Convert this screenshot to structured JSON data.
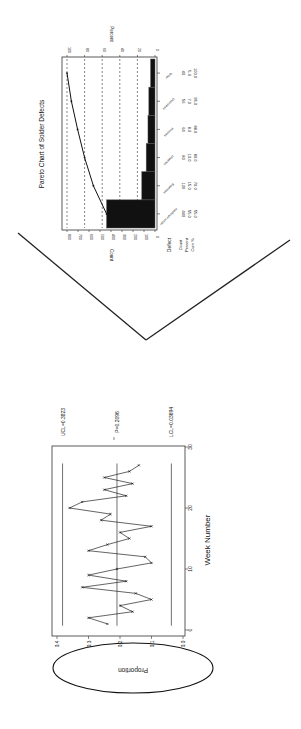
{
  "chart_data": [
    {
      "type": "bar",
      "title": "Pareto Chart of Solder Defects",
      "orientation_note": "figure rotated 90 degrees clockwise on page",
      "xlabel": "Defect",
      "ylabel": "Count",
      "ylabel_right": "Percent",
      "ylim": [
        0,
        800
      ],
      "yticks": [
        0,
        100,
        200,
        300,
        400,
        500,
        600,
        700,
        800
      ],
      "yticks_right": [
        0,
        20,
        40,
        60,
        80,
        100
      ],
      "grid": "dashed at percent ticks",
      "categories": [
        "Insufficient solder",
        "Blowholes",
        "Unwetted",
        "Pinholes",
        "Unsoldered",
        "Other"
      ],
      "series": [
        {
          "name": "Count",
          "values": [
            440,
            120,
            80,
            64,
            56,
            40
          ]
        },
        {
          "name": "Percent",
          "values": [
            55.0,
            15.0,
            10.0,
            8.0,
            7.0,
            5.0
          ]
        },
        {
          "name": "Cum %",
          "values": [
            55.0,
            70.0,
            80.0,
            88.0,
            95.0,
            100.0
          ]
        }
      ],
      "table_row_labels": [
        "Defect",
        "Count",
        "Percent",
        "Cum %"
      ]
    },
    {
      "type": "line",
      "title": "",
      "orientation_note": "figure rotated 90 degrees clockwise on page",
      "xlabel": "Week Number",
      "ylabel": "Proportion",
      "xlim": [
        0,
        30
      ],
      "ylim": [
        0.0,
        0.4
      ],
      "xticks": [
        0,
        10,
        20,
        30
      ],
      "yticks": [
        0.0,
        0.1,
        0.2,
        0.3,
        0.4
      ],
      "x": [
        1,
        2,
        3,
        4,
        5,
        6,
        7,
        8,
        9,
        10,
        11,
        12,
        13,
        14,
        15,
        16,
        17,
        18,
        19,
        20,
        21,
        22,
        23,
        24,
        25,
        26,
        27
      ],
      "series": [
        {
          "name": "Proportion",
          "values": [
            0.24,
            0.3,
            0.16,
            0.2,
            0.1,
            0.15,
            0.32,
            0.18,
            0.3,
            0.21,
            0.1,
            0.12,
            0.3,
            0.24,
            0.17,
            0.2,
            0.1,
            0.26,
            0.23,
            0.36,
            0.32,
            0.18,
            0.25,
            0.16,
            0.25,
            0.17,
            0.14
          ]
        }
      ],
      "reference_lines": [
        {
          "label": "UCL=0.3823",
          "value": 0.3823
        },
        {
          "label": "P=0.2096",
          "value": 0.2096
        },
        {
          "label": "LCL=0.03694",
          "value": 0.03694
        }
      ],
      "annotation": "ellipse drawn around y-axis label Proportion"
    }
  ],
  "pareto": {
    "title": "Pareto Chart of Solder Defects",
    "count_label": "Count",
    "percent_label": "Percent",
    "count_ticks": [
      "0",
      "100",
      "200",
      "300",
      "400",
      "500",
      "600",
      "700",
      "800"
    ],
    "percent_ticks": [
      "0",
      "20",
      "40",
      "60",
      "80",
      "100"
    ],
    "row_labels": {
      "defect": "Defect",
      "count": "Count",
      "percent": "Percent",
      "cum": "Cum %"
    },
    "columns": [
      {
        "name": "Insufficient solder",
        "count": "440",
        "percent": "55.0",
        "cum": "55.0"
      },
      {
        "name": "Blowholes",
        "count": "120",
        "percent": "15.0",
        "cum": "70.0"
      },
      {
        "name": "Unwetted",
        "count": "80",
        "percent": "10.0",
        "cum": "80.0"
      },
      {
        "name": "Pinholes",
        "count": "64",
        "percent": "8.0",
        "cum": "88.0"
      },
      {
        "name": "Unsoldered",
        "count": "56",
        "percent": "7.0",
        "cum": "95.0"
      },
      {
        "name": "Other",
        "count": "40",
        "percent": "5.0",
        "cum": "100.0"
      }
    ]
  },
  "control": {
    "xlabel": "Week Number",
    "ylabel": "Proportion",
    "x_ticks": [
      "0",
      "10",
      "20",
      "30"
    ],
    "y_ticks": [
      "0.0",
      "0.1",
      "0.2",
      "0.3",
      "0.4"
    ],
    "ucl_label": "UCL=0.3823",
    "center_label": "P=0.2096",
    "lcl_label": "LCL=0.03694"
  }
}
